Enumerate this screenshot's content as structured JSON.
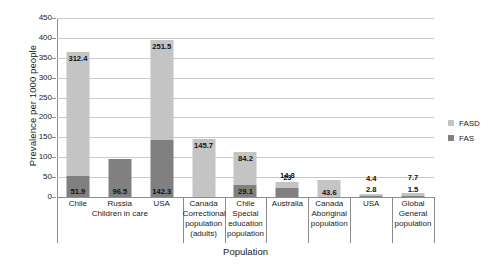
{
  "chart_data": {
    "type": "bar",
    "stacked": true,
    "title": "",
    "xlabel": "Population",
    "ylabel": "Prevalence per 1000 people",
    "ylim": [
      0,
      450
    ],
    "ytick_step": 50,
    "yticks": [
      "450",
      "400",
      "350",
      "300",
      "250",
      "200",
      "150",
      "100",
      "50",
      "0"
    ],
    "grid": true,
    "legend_position": "right",
    "categories": [
      "Chile",
      "Russia",
      "USA",
      "Canada Correctional population (adults)",
      "Chile Special education population",
      "Australia",
      "Canada Aboriginal population",
      "USA",
      "Global General population"
    ],
    "category_lines": [
      [
        "Chile"
      ],
      [
        "Russia"
      ],
      [
        "USA"
      ],
      [
        "Canada",
        "Correctional",
        "population",
        "(adults)"
      ],
      [
        "Chile",
        "Special",
        "education",
        "population"
      ],
      [
        "Australia"
      ],
      [
        "Canada",
        "Aboriginal",
        "population"
      ],
      [
        "USA"
      ],
      [
        "Global",
        "General",
        "population"
      ]
    ],
    "group_labels": [
      {
        "text": "Children in care",
        "spans": [
          0,
          1,
          2
        ]
      }
    ],
    "series": [
      {
        "name": "FASD",
        "color": "#c4c4c4",
        "values": [
          312.4,
          0,
          251.5,
          145.7,
          84.2,
          14.8,
          43.6,
          4.4,
          7.7
        ]
      },
      {
        "name": "FAS",
        "color": "#808080",
        "values": [
          51.9,
          96.5,
          142.3,
          0,
          29.1,
          23,
          0,
          2.8,
          1.5
        ]
      }
    ],
    "value_labels": {
      "fasd": [
        "312.4",
        "",
        "251.5",
        "145.7",
        "84.2",
        "14.8",
        "43.6",
        "4.4",
        "7.7"
      ],
      "fas": [
        "51.9",
        "96.5",
        "142.3",
        "",
        "29.1",
        "23",
        "",
        "2.8",
        "1.5"
      ]
    }
  },
  "legend": {
    "items": [
      {
        "label": "FASD",
        "color": "#c4c4c4"
      },
      {
        "label": "FAS",
        "color": "#808080"
      }
    ]
  },
  "axes": {
    "y_title": "Prevalence per 1000 people",
    "x_title": "Population"
  }
}
